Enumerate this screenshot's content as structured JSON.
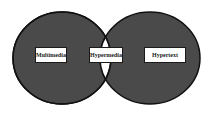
{
  "diagram": {
    "type": "venn",
    "sets": [
      {
        "id": "left",
        "label": "Multimedia",
        "fill": "#4a4a4a"
      },
      {
        "id": "right",
        "label": "Hypertext",
        "fill": "#4a4a4a"
      }
    ],
    "intersection": {
      "label": "Hypermedia",
      "fill": "#ffffff"
    },
    "colors": {
      "set_fill": "#4a4a4a",
      "outline": "#111111",
      "intersection_fill": "#ffffff",
      "label_bg": "#ffffff"
    }
  }
}
